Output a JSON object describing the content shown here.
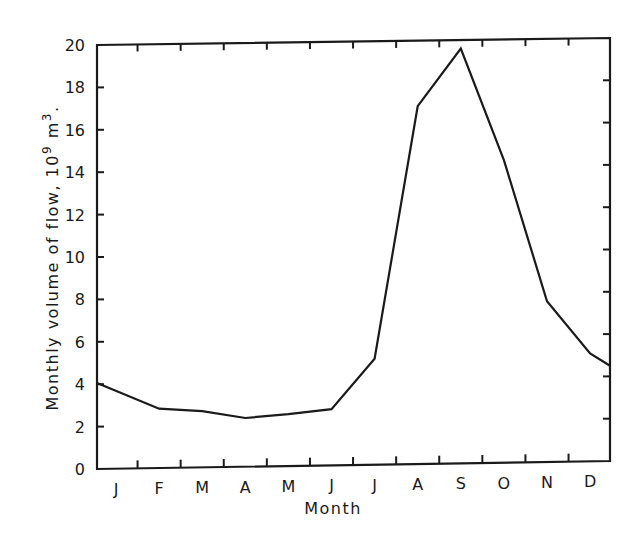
{
  "chart_data": {
    "type": "line",
    "title": "",
    "xlabel": "Month",
    "ylabel": "Monthly volume of flow, 10⁹ m³.",
    "ylabel_parts": {
      "main": "Monthly volume of flow, 10",
      "sup1": "9",
      "mid": " m",
      "sup2": "3",
      "end": "."
    },
    "categories": [
      "J",
      "F",
      "M",
      "A",
      "M",
      "J",
      "J",
      "A",
      "S",
      "O",
      "N",
      "D"
    ],
    "x": [
      "start",
      "J",
      "F",
      "M",
      "A",
      "M",
      "J",
      "J",
      "A",
      "S",
      "O",
      "N",
      "D",
      "end"
    ],
    "series": [
      {
        "name": "Monthly volume of flow",
        "points": [
          {
            "x": "start",
            "y": 4.05
          },
          {
            "x": "F",
            "y": 2.8
          },
          {
            "x": "M",
            "y": 2.65
          },
          {
            "x": "A",
            "y": 2.3
          },
          {
            "x": "M",
            "y": 2.45
          },
          {
            "x": "J",
            "y": 2.65
          },
          {
            "x": "J",
            "y": 5.0
          },
          {
            "x": "A",
            "y": 16.9
          },
          {
            "x": "S",
            "y": 19.6
          },
          {
            "x": "O",
            "y": 14.3
          },
          {
            "x": "N",
            "y": 7.6
          },
          {
            "x": "D",
            "y": 5.1
          },
          {
            "x": "end",
            "y": 4.5
          }
        ],
        "values_by_month": [
          4.0,
          2.8,
          2.65,
          2.3,
          2.45,
          2.65,
          5.0,
          16.9,
          19.6,
          14.3,
          7.6,
          5.1
        ],
        "color": "#1a1a1a"
      }
    ],
    "yticks": [
      "0",
      "2",
      "4",
      "6",
      "8",
      "10",
      "12",
      "14",
      "16",
      "18",
      "20"
    ],
    "ylim": [
      0,
      20
    ],
    "grid": false,
    "legend": "none"
  }
}
